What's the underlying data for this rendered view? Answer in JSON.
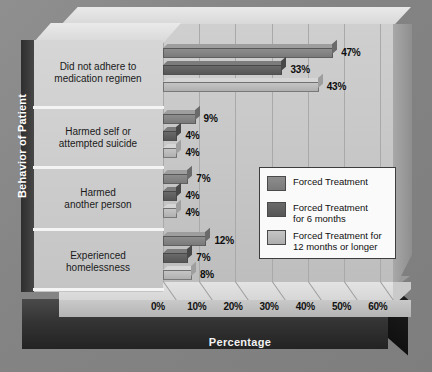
{
  "chart_data": {
    "type": "bar",
    "title": "",
    "orientation": "horizontal",
    "xlabel": "Percentage",
    "ylabel": "Behavior of Patient",
    "xlim": [
      0,
      70
    ],
    "xticks": [
      "0%",
      "10%",
      "20%",
      "30%",
      "40%",
      "50%",
      "60%"
    ],
    "grid": true,
    "legend_position": "inside-right",
    "categories": [
      "Did not adhere to\nmedication regimen",
      "Harmed self or\nattempted suicide",
      "Harmed\nanother person",
      "Experienced\nhomelessness"
    ],
    "series": [
      {
        "name": "Forced Treatment",
        "color": "#7f7f7f",
        "values": [
          47,
          9,
          7,
          12
        ],
        "labels": [
          "47%",
          "9%",
          "7%",
          "12%"
        ]
      },
      {
        "name": "Forced Treatment\nfor 6 months",
        "color": "#5b5b5b",
        "values": [
          33,
          4,
          4,
          7
        ],
        "labels": [
          "33%",
          "4%",
          "4%",
          "7%"
        ]
      },
      {
        "name": "Forced Treatment for\n12 months or longer",
        "color": "#b8b8b8",
        "values": [
          43,
          4,
          4,
          8
        ],
        "labels": [
          "43%",
          "4%",
          "4%",
          "8%"
        ]
      }
    ]
  },
  "colors": {
    "background": "#8a8a8a",
    "plot_wall": "#c6c6c6",
    "base": "#2b2b2b",
    "series1": "#7f7f7f",
    "series2": "#5b5b5b",
    "series3": "#b8b8b8"
  }
}
